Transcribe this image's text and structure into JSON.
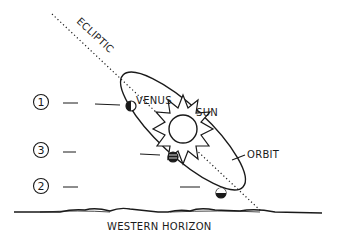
{
  "diagram": {
    "labels": {
      "ecliptic": "ECLIPTIC",
      "venus": "VENUS",
      "sun": "SUN",
      "orbit": "ORBIT",
      "horizon": "WESTERN HORIZON"
    },
    "positions": [
      {
        "number": "1"
      },
      {
        "number": "3"
      },
      {
        "number": "2"
      }
    ],
    "colors": {
      "ink": "#1a1a1a",
      "background": "#ffffff"
    }
  }
}
